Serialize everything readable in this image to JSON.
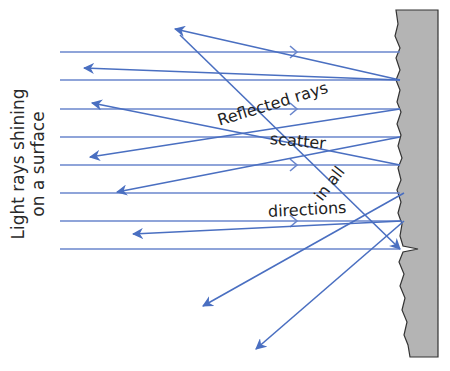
{
  "diagram": {
    "side_label": {
      "line1": "Light rays shining",
      "line2": "on a surface"
    },
    "labels": {
      "reflected_rays": "Reflected rays",
      "scatter": "scatter",
      "in_all": "in all",
      "directions": "directions"
    },
    "colors": {
      "ray": "#4a6fc1",
      "incident_ray": "#5b7bc8",
      "surface_fill": "#b4b4b4",
      "surface_edge": "#333333",
      "text": "#222222"
    },
    "incident_rays": {
      "count": 8,
      "x_start": 60,
      "y_positions": [
        52,
        80,
        109,
        137,
        165,
        193,
        221,
        249
      ],
      "chevron_lines": [
        52,
        109,
        165,
        221
      ],
      "chevron_x": 295
    },
    "reflected_rays": [
      {
        "from": [
          400,
          80
        ],
        "to": [
          175,
          29
        ]
      },
      {
        "from": [
          400,
          80
        ],
        "to": [
          84,
          68
        ]
      },
      {
        "from": [
          400,
          165
        ],
        "to": [
          92,
          103
        ]
      },
      {
        "from": [
          400,
          109
        ],
        "to": [
          90,
          157
        ]
      },
      {
        "from": [
          400,
          137
        ],
        "to": [
          117,
          192
        ]
      },
      {
        "from": [
          402,
          221
        ],
        "to": [
          133,
          234
        ]
      },
      {
        "from": [
          404,
          193
        ],
        "to": [
          203,
          306
        ]
      },
      {
        "from": [
          404,
          221
        ],
        "to": [
          256,
          349
        ]
      },
      {
        "from": [
          180,
          35
        ],
        "to": [
          400,
          249
        ]
      }
    ]
  }
}
